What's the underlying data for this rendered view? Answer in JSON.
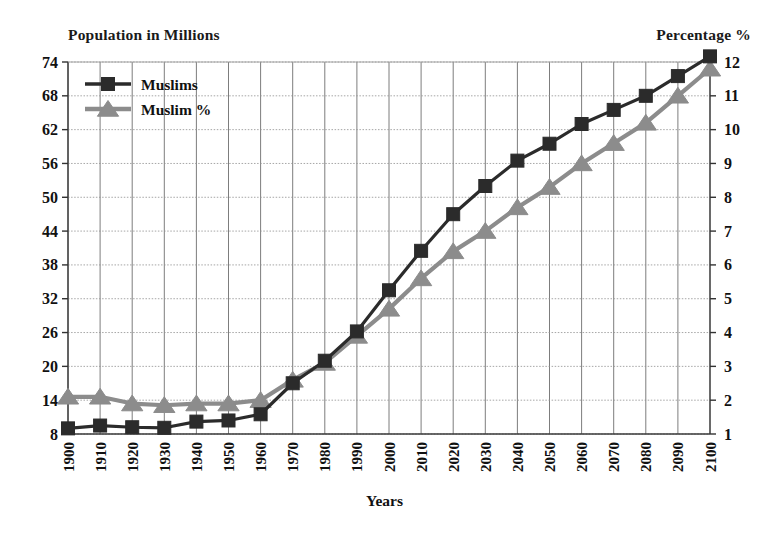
{
  "chart_data": {
    "type": "line",
    "title": "",
    "left_axis_title": "Population in Millions",
    "right_axis_title": "Percentage %",
    "xlabel": "Years",
    "ylabel": "Population in Millions",
    "y2label": "Percentage %",
    "grid": true,
    "legend_position": "top-left",
    "ylim": [
      8,
      74
    ],
    "y2lim": [
      1,
      12
    ],
    "yticks": [
      8,
      14,
      20,
      26,
      32,
      38,
      44,
      50,
      56,
      62,
      68,
      74
    ],
    "y2ticks": [
      1,
      2,
      3,
      4,
      5,
      6,
      7,
      8,
      9,
      10,
      11,
      12
    ],
    "x": [
      "1900",
      "1910",
      "1920",
      "1930",
      "1940",
      "1950",
      "1960",
      "1970",
      "1980",
      "1990",
      "2000",
      "2010",
      "2020",
      "2030",
      "2040",
      "2050",
      "2060",
      "2070",
      "2080",
      "2090",
      "2100"
    ],
    "categories": [
      "1900",
      "1910",
      "1920",
      "1930",
      "1940",
      "1950",
      "1960",
      "1970",
      "1980",
      "1990",
      "2000",
      "2010",
      "2020",
      "2030",
      "2040",
      "2050",
      "2060",
      "2070",
      "2080",
      "2090",
      "2100"
    ],
    "series": [
      {
        "name": "Muslims",
        "axis": "left",
        "color": "#2b2b2b",
        "marker": "square",
        "values": [
          9.0,
          9.5,
          9.2,
          9.1,
          10.2,
          10.4,
          11.5,
          17.0,
          21.0,
          26.2,
          33.5,
          40.5,
          47.0,
          52.0,
          56.5,
          59.5,
          63.0,
          65.5,
          68.0,
          71.5,
          75.0
        ]
      },
      {
        "name": "Muslim %",
        "axis": "right",
        "color": "#8c8c8c",
        "marker": "triangle",
        "values": [
          2.1,
          2.1,
          1.9,
          1.85,
          1.9,
          1.9,
          2.0,
          2.6,
          3.1,
          3.9,
          4.7,
          5.6,
          6.4,
          7.0,
          7.7,
          8.3,
          9.0,
          9.6,
          10.2,
          11.0,
          11.8
        ]
      }
    ]
  },
  "legend": {
    "items": [
      {
        "label": "Muslims",
        "color": "#2b2b2b",
        "marker": "square"
      },
      {
        "label": "Muslim %",
        "color": "#8c8c8c",
        "marker": "triangle"
      }
    ]
  }
}
